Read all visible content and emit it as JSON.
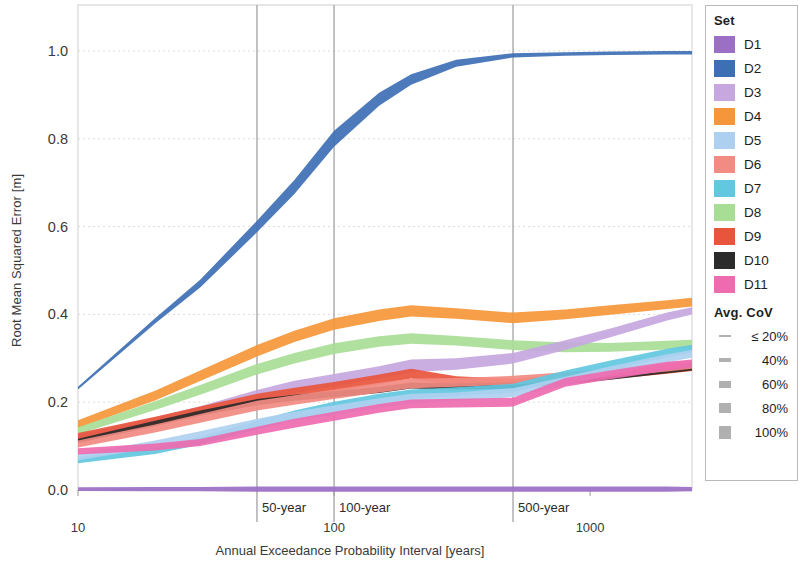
{
  "chart_data": {
    "type": "area",
    "title": "",
    "xlabel": "Annual Exceedance Probability Interval [years]",
    "ylabel": "Root Mean Squared Error [m]",
    "xscale": "log",
    "xlim": [
      10,
      2500
    ],
    "ylim": [
      0.0,
      1.05
    ],
    "xticks": [
      10,
      100,
      1000
    ],
    "xtick_labels": [
      "10",
      "100",
      "1000"
    ],
    "yticks": [
      0.0,
      0.2,
      0.4,
      0.6,
      0.8,
      1.0
    ],
    "ytick_labels": [
      "0.0",
      "0.2",
      "0.4",
      "0.6",
      "0.8",
      "1.0"
    ],
    "grid": true,
    "legend_position": "right",
    "annotations": [
      {
        "label": "50-year",
        "x": 50
      },
      {
        "label": "100-year",
        "x": 100
      },
      {
        "label": "500-year",
        "x": 500
      }
    ],
    "x": [
      10,
      20,
      30,
      50,
      70,
      100,
      150,
      200,
      300,
      500,
      800,
      1200,
      2000,
      2500
    ],
    "series": [
      {
        "name": "D1",
        "color": "#9b6fc4",
        "mid": [
          0.002,
          0.002,
          0.002,
          0.002,
          0.002,
          0.002,
          0.002,
          0.002,
          0.002,
          0.002,
          0.002,
          0.002,
          0.002,
          0.002
        ],
        "halfw": [
          0.004,
          0.005,
          0.005,
          0.006,
          0.006,
          0.006,
          0.006,
          0.006,
          0.006,
          0.006,
          0.006,
          0.006,
          0.006,
          0.005
        ]
      },
      {
        "name": "D2",
        "color": "#3d6fb4",
        "mid": [
          0.232,
          0.385,
          0.47,
          0.6,
          0.69,
          0.8,
          0.89,
          0.935,
          0.972,
          0.99,
          0.993,
          0.995,
          0.996,
          0.996
        ],
        "halfw": [
          0.003,
          0.006,
          0.009,
          0.013,
          0.016,
          0.018,
          0.015,
          0.012,
          0.008,
          0.005,
          0.004,
          0.004,
          0.004,
          0.004
        ]
      },
      {
        "name": "D3",
        "color": "#c6a7e0",
        "mid": [
          0.118,
          0.155,
          0.18,
          0.215,
          0.235,
          0.25,
          0.268,
          0.283,
          0.287,
          0.3,
          0.33,
          0.358,
          0.395,
          0.408
        ],
        "halfw": [
          0.008,
          0.01,
          0.011,
          0.013,
          0.014,
          0.014,
          0.014,
          0.014,
          0.013,
          0.012,
          0.011,
          0.01,
          0.009,
          0.008
        ]
      },
      {
        "name": "D4",
        "color": "#f6963a",
        "mid": [
          0.15,
          0.215,
          0.26,
          0.317,
          0.35,
          0.378,
          0.398,
          0.408,
          0.402,
          0.392,
          0.4,
          0.41,
          0.422,
          0.428
        ],
        "halfw": [
          0.009,
          0.011,
          0.012,
          0.013,
          0.013,
          0.013,
          0.013,
          0.013,
          0.012,
          0.012,
          0.011,
          0.011,
          0.01,
          0.01
        ]
      },
      {
        "name": "D5",
        "color": "#aed0f0",
        "mid": [
          0.075,
          0.105,
          0.125,
          0.152,
          0.168,
          0.182,
          0.198,
          0.208,
          0.212,
          0.222,
          0.248,
          0.272,
          0.3,
          0.31
        ],
        "halfw": [
          0.007,
          0.008,
          0.009,
          0.01,
          0.01,
          0.011,
          0.011,
          0.011,
          0.01,
          0.01,
          0.01,
          0.01,
          0.009,
          0.009
        ]
      },
      {
        "name": "D6",
        "color": "#f28b82",
        "mid": [
          0.105,
          0.14,
          0.163,
          0.192,
          0.205,
          0.218,
          0.233,
          0.243,
          0.245,
          0.25,
          0.258,
          0.268,
          0.28,
          0.285
        ],
        "halfw": [
          0.008,
          0.009,
          0.01,
          0.011,
          0.011,
          0.011,
          0.011,
          0.011,
          0.01,
          0.01,
          0.01,
          0.01,
          0.01,
          0.009
        ]
      },
      {
        "name": "D7",
        "color": "#62c8e0",
        "mid": [
          0.068,
          0.09,
          0.112,
          0.148,
          0.17,
          0.19,
          0.208,
          0.218,
          0.224,
          0.232,
          0.262,
          0.285,
          0.312,
          0.322
        ],
        "halfw": [
          0.007,
          0.008,
          0.009,
          0.01,
          0.011,
          0.011,
          0.011,
          0.011,
          0.01,
          0.01,
          0.01,
          0.01,
          0.01,
          0.009
        ]
      },
      {
        "name": "D8",
        "color": "#a8dd96",
        "mid": [
          0.135,
          0.192,
          0.228,
          0.275,
          0.3,
          0.322,
          0.338,
          0.345,
          0.34,
          0.33,
          0.325,
          0.325,
          0.33,
          0.332
        ],
        "halfw": [
          0.008,
          0.01,
          0.011,
          0.012,
          0.012,
          0.012,
          0.012,
          0.012,
          0.011,
          0.011,
          0.011,
          0.01,
          0.01,
          0.01
        ]
      },
      {
        "name": "D9",
        "color": "#e8553c",
        "mid": [
          0.122,
          0.158,
          0.18,
          0.208,
          0.222,
          0.235,
          0.252,
          0.265,
          0.248,
          0.243,
          0.252,
          0.262,
          0.275,
          0.28
        ],
        "halfw": [
          0.008,
          0.009,
          0.01,
          0.011,
          0.011,
          0.011,
          0.011,
          0.011,
          0.011,
          0.01,
          0.01,
          0.01,
          0.01,
          0.009
        ]
      },
      {
        "name": "D10",
        "color": "#2b2b2b",
        "mid": [
          0.112,
          0.152,
          0.175,
          0.2,
          0.21,
          0.218,
          0.228,
          0.238,
          0.236,
          0.238,
          0.248,
          0.258,
          0.272,
          0.278
        ],
        "halfw": [
          0.005,
          0.006,
          0.006,
          0.007,
          0.007,
          0.007,
          0.007,
          0.007,
          0.007,
          0.007,
          0.007,
          0.007,
          0.006,
          0.006
        ]
      },
      {
        "name": "D11",
        "color": "#ee6bb0",
        "mid": [
          0.088,
          0.098,
          0.108,
          0.135,
          0.152,
          0.168,
          0.186,
          0.196,
          0.198,
          0.2,
          0.245,
          0.262,
          0.282,
          0.288
        ],
        "halfw": [
          0.007,
          0.008,
          0.008,
          0.009,
          0.01,
          0.01,
          0.01,
          0.01,
          0.01,
          0.01,
          0.01,
          0.01,
          0.01,
          0.009
        ]
      }
    ]
  },
  "legend": {
    "set_title": "Set",
    "items": [
      {
        "label": "D1",
        "color": "#9b6fc4"
      },
      {
        "label": "D2",
        "color": "#3d6fb4"
      },
      {
        "label": "D3",
        "color": "#c6a7e0"
      },
      {
        "label": "D4",
        "color": "#f6963a"
      },
      {
        "label": "D5",
        "color": "#aed0f0"
      },
      {
        "label": "D6",
        "color": "#f28b82"
      },
      {
        "label": "D7",
        "color": "#62c8e0"
      },
      {
        "label": "D8",
        "color": "#a8dd96"
      },
      {
        "label": "D9",
        "color": "#e8553c"
      },
      {
        "label": "D10",
        "color": "#2b2b2b"
      },
      {
        "label": "D11",
        "color": "#ee6bb0"
      }
    ],
    "cov_title": "Avg. CoV",
    "cov_items": [
      {
        "label": "≤ 20%",
        "thickness": 2
      },
      {
        "label": "40%",
        "thickness": 4
      },
      {
        "label": "60%",
        "thickness": 7
      },
      {
        "label": "80%",
        "thickness": 10
      },
      {
        "label": "100%",
        "thickness": 13
      }
    ]
  }
}
